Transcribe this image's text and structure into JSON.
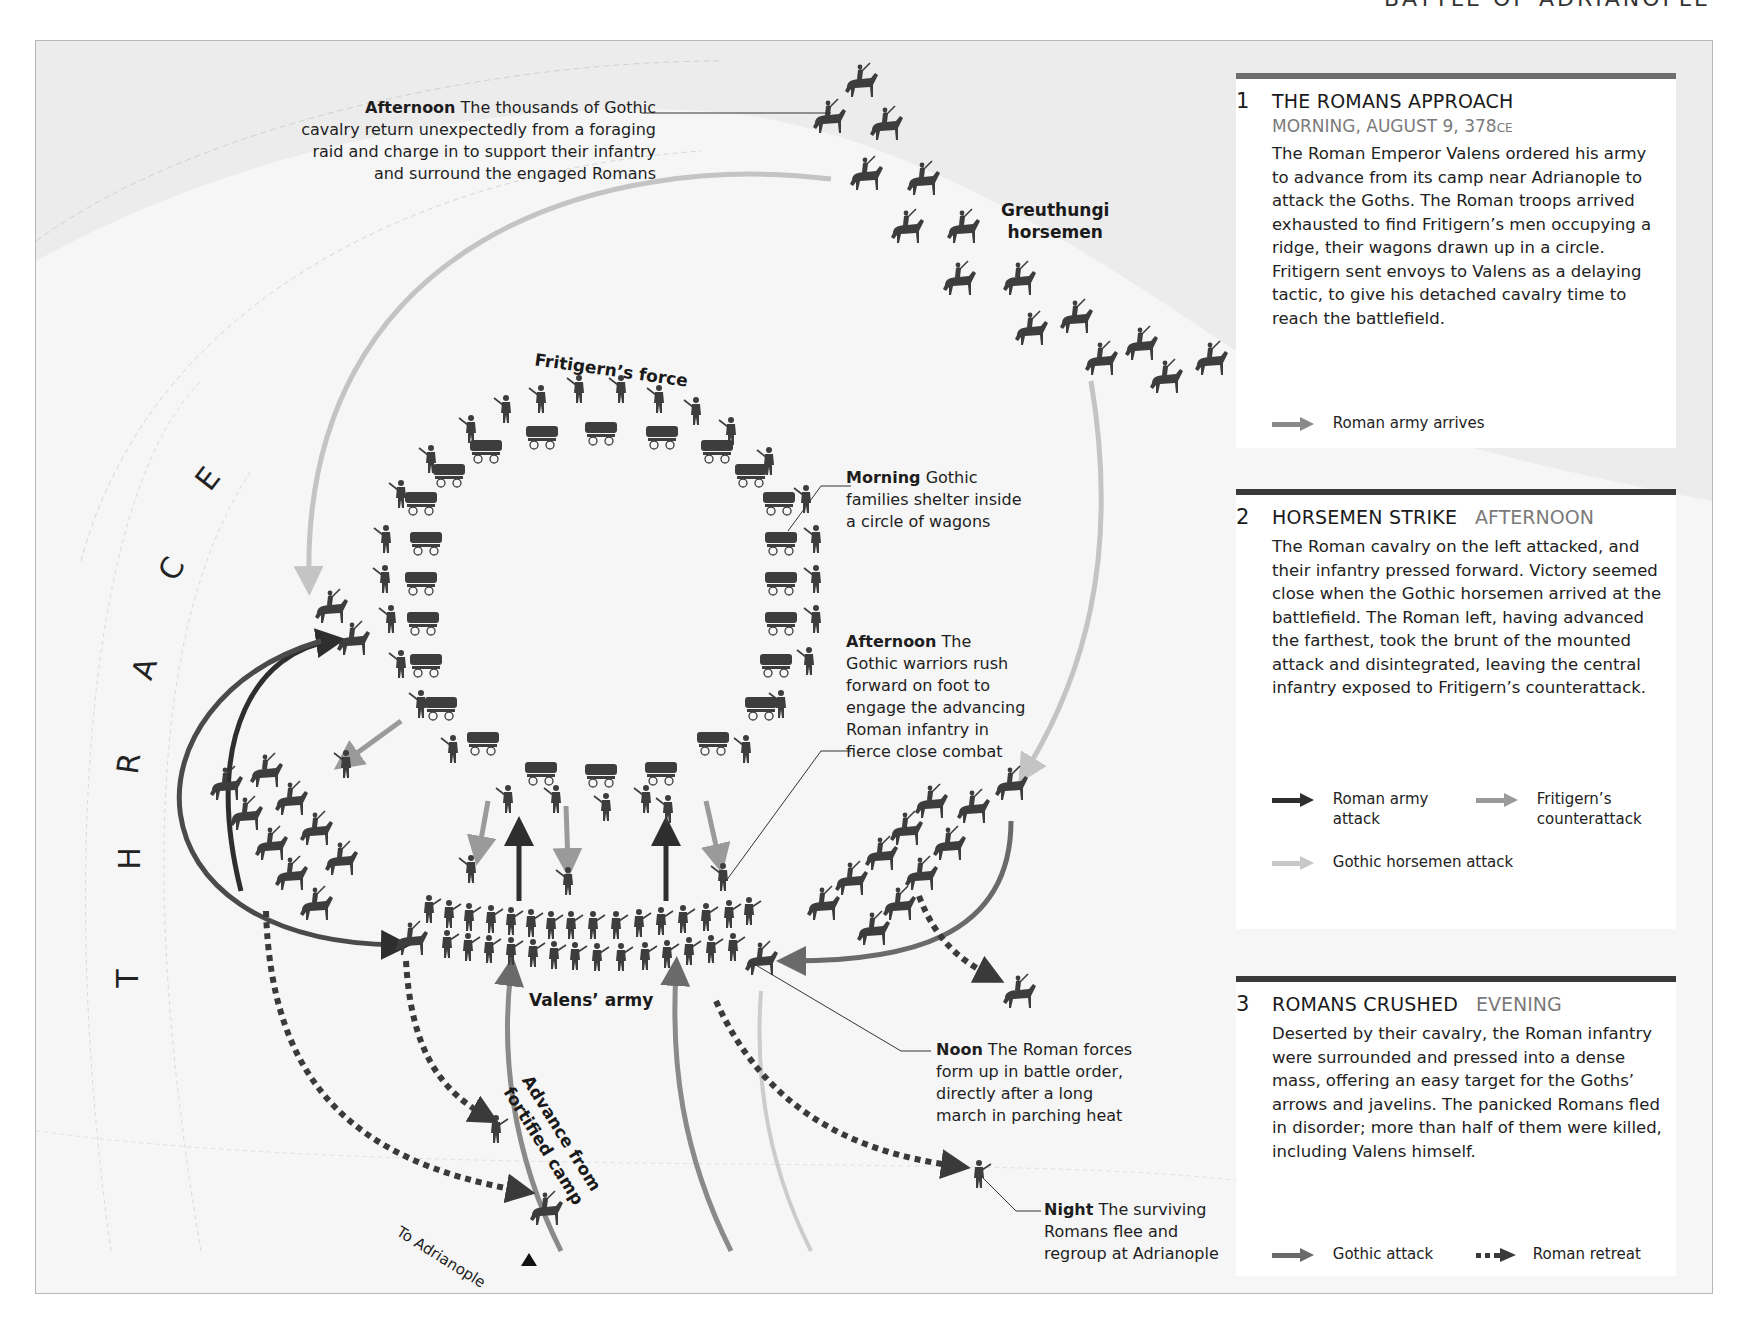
{
  "running_head": "BATTLE OF ADRIANOPLE",
  "region_label": [
    "T",
    "H",
    "R",
    "A",
    "C",
    "E"
  ],
  "map_labels": {
    "fritigern_force": "Fritigern’s force",
    "greuthungi": [
      "Greuthungi",
      "horsemen"
    ],
    "valens_army": "Valens’ army",
    "advance": [
      "Advance from",
      "fortified camp"
    ],
    "to_adrianople": "To Adrianople"
  },
  "annotations": [
    {
      "id": "afternoon-cavalry",
      "time": "Afternoon",
      "text": "The thousands of Gothic",
      "lines": [
        "cavalry return unexpectedly from a foraging",
        "raid and charge in to support their infantry",
        "and surround the engaged Romans"
      ]
    },
    {
      "id": "morning-families",
      "time": "Morning",
      "text": "Gothic",
      "lines": [
        "families shelter inside",
        "a circle of wagons"
      ]
    },
    {
      "id": "afternoon-warriors",
      "time": "Afternoon",
      "text": "The",
      "lines": [
        "Gothic warriors rush",
        "forward on foot to",
        "engage the advancing",
        "Roman infantry in",
        "fierce close combat"
      ]
    },
    {
      "id": "noon-romans",
      "time": "Noon",
      "text": "The Roman forces",
      "lines": [
        "form up in battle order,",
        "directly after a long",
        "march in parching heat"
      ]
    },
    {
      "id": "night-flee",
      "time": "Night",
      "text": "The surviving",
      "lines": [
        "Romans flee and",
        "regroup at Adrianople"
      ]
    }
  ],
  "panels": [
    {
      "number": "1",
      "title": "THE ROMANS APPROACH",
      "time": "MORNING, AUGUST 9, 378",
      "time_suffix": "CE",
      "body": "The Roman Emperor Valens ordered his army to advance from its camp near Adrianople to attack the Goths. The Roman troops arrived exhausted to find Fritigern’s men occupying a ridge, their wagons drawn up in a circle. Fritigern sent envoys to Valens as a delaying tactic, to give his detached cavalry time to reach the battlefield.",
      "legend": [
        {
          "label": "Roman army arrives",
          "color": "#8a8a8a",
          "style": "solid"
        }
      ]
    },
    {
      "number": "2",
      "title": "HORSEMEN STRIKE",
      "time": "AFTERNOON",
      "body": "The Roman cavalry on the left attacked, and their infantry pressed forward. Victory seemed close when the Gothic horsemen arrived at the battlefield. The Roman left, having advanced the farthest, took the brunt of the mounted attack and disintegrated, leaving the central infantry exposed to Fritigern’s counterattack.",
      "legend": [
        {
          "label": "Roman army attack",
          "lines": [
            "Roman army",
            "attack"
          ],
          "color": "#2e2e2e",
          "style": "solid"
        },
        {
          "label": "Fritigern’s counterattack",
          "lines": [
            "Fritigern’s",
            "counterattack"
          ],
          "color": "#9a9a9a",
          "style": "solid"
        },
        {
          "label": "Gothic horsemen attack",
          "color": "#c8c8c8",
          "style": "solid"
        }
      ]
    },
    {
      "number": "3",
      "title": "ROMANS CRUSHED",
      "time": "EVENING",
      "body": "Deserted by their cavalry, the Roman infantry were surrounded and pressed into a dense mass, offering an easy target for the Goths’ arrows and javelins. The panicked Romans fled in disorder; more than half of them were killed, including Valens himself.",
      "legend": [
        {
          "label": "Gothic attack",
          "color": "#6a6a6a",
          "style": "solid"
        },
        {
          "label": "Roman retreat",
          "color": "#3a3a3a",
          "style": "dotted"
        }
      ]
    }
  ],
  "colors": {
    "roman_attack": "#2e2e2e",
    "fritigern_counter": "#9a9a9a",
    "gothic_horse": "#c8c8c8",
    "gothic_attack": "#6a6a6a",
    "roman_arrive": "#8a8a8a",
    "unit": "#3d3d3d",
    "background": "#f6f6f6"
  }
}
